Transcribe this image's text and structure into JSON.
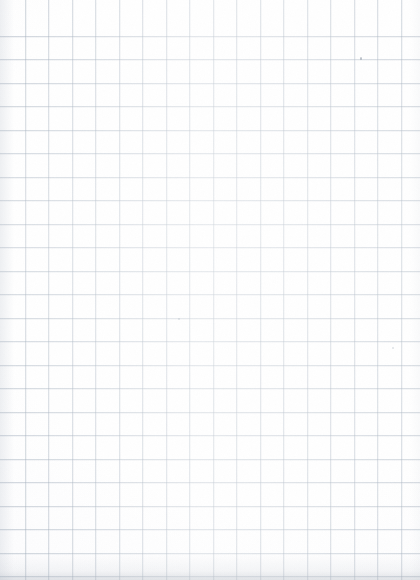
{
  "document": {
    "kind": "scanned-grid-paper",
    "title": "Blank grid paper scan",
    "page_width_px": 420,
    "page_height_px": 580,
    "visible_text": "",
    "has_text": false,
    "has_handwriting": false
  },
  "paper": {
    "background_color": "#ffffff",
    "base_tint_color": "#fbfbfc",
    "surface_label": "",
    "orientation": "portrait"
  },
  "grid": {
    "style": "square-ruled",
    "line_color": "#96a4b4",
    "ghost_line_color": "#aab4c4",
    "cell_size_px": 23.5,
    "vertical_offset_px": 2,
    "horizontal_offset_px": 13,
    "approx_columns": 18,
    "approx_rows": 24,
    "line_weight_px": 1
  },
  "shading": {
    "bottom_edge_color": "#a8b0ba",
    "left_edge_color": "#b2bac6",
    "right_edge_color": "#c8ced6",
    "vignette_label": ""
  },
  "marks": [
    {
      "name": "ink-speck-upper-right",
      "x_px": 360,
      "y_px": 57,
      "variant": "dot"
    },
    {
      "name": "ink-speck-lower-right",
      "x_px": 392,
      "y_px": 347,
      "variant": "faint"
    },
    {
      "name": "ink-speck-mid-left",
      "x_px": 178,
      "y_px": 318,
      "variant": "faint"
    }
  ]
}
